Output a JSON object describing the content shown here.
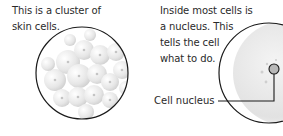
{
  "left_panel": {
    "caption_line1": "This is a cluster of",
    "caption_line2": "skin cells."
  },
  "right_panel": {
    "caption_line1": "Inside most cells is",
    "caption_line2": "a nucleus. This",
    "caption_line3": "tells the cell",
    "caption_line4": "what to do.",
    "nucleus_label": "Cell nucleus"
  },
  "colors": {
    "outline": "#1a1a1a",
    "cell_fill": "#e9e9e9",
    "cell_shade": "#d4d4d4",
    "nucleus_dot": "#b8b8b8"
  }
}
